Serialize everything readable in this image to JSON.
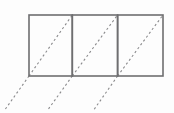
{
  "figure": {
    "background_color": "#fdfdfd",
    "outline_color": "#6e6e70",
    "diagonal_color": "#8a8a8c",
    "outline_width": 1.6,
    "diagonal_width": 1.1,
    "diagonal_dash": "2.2 2.6",
    "grid": {
      "left": 29,
      "top": 15,
      "right": 163,
      "bottom": 76,
      "cell_count": 3,
      "divider_x": [
        72.3,
        117.6
      ]
    },
    "boxes": [
      {
        "name": "box-left",
        "x": 29,
        "y": 15,
        "width": 43.3,
        "height": 61
      },
      {
        "name": "box-middle",
        "x": 72.3,
        "y": 15,
        "width": 45.3,
        "height": 61
      },
      {
        "name": "box-right",
        "x": 117.6,
        "y": 15,
        "width": 45.4,
        "height": 61
      }
    ],
    "diagonals": [
      {
        "name": "diagonal-1",
        "x1": 29,
        "y1": 76,
        "x2": 72.3,
        "y2": 15
      },
      {
        "name": "diagonal-2",
        "x1": 72.3,
        "y1": 76,
        "x2": 117.6,
        "y2": 15
      },
      {
        "name": "diagonal-3",
        "x1": 117.6,
        "y1": 76,
        "x2": 163,
        "y2": 15
      }
    ],
    "diagonal_extensions": [
      {
        "name": "diagonal-extension-1",
        "x1": 29,
        "y1": 76,
        "x2": 4,
        "y2": 111
      },
      {
        "name": "diagonal-extension-2",
        "x1": 72.3,
        "y1": 76,
        "x2": 47,
        "y2": 111
      },
      {
        "name": "diagonal-extension-3",
        "x1": 117.6,
        "y1": 76,
        "x2": 93,
        "y2": 111
      }
    ]
  }
}
